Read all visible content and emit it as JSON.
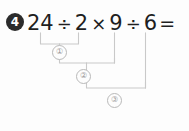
{
  "problem": {
    "number_label": "4",
    "expression_tokens": [
      {
        "kind": "num",
        "text": "24"
      },
      {
        "kind": "op",
        "text": "÷"
      },
      {
        "kind": "num",
        "text": "2"
      },
      {
        "kind": "op",
        "text": "×"
      },
      {
        "kind": "num",
        "text": "9"
      },
      {
        "kind": "op",
        "text": "÷"
      },
      {
        "kind": "num",
        "text": "6"
      },
      {
        "kind": "eq",
        "text": "="
      }
    ],
    "expression_text": "24 ÷ 2 × 9 ÷ 6 =",
    "answer_value": ""
  },
  "steps": [
    {
      "order_label": "①",
      "operation": "÷",
      "operands": [
        "24",
        "2"
      ],
      "covers": "24 ÷ 2"
    },
    {
      "order_label": "②",
      "operation": "×",
      "operands": [
        "step1",
        "9"
      ],
      "covers": "(24 ÷ 2) × 9"
    },
    {
      "order_label": "③",
      "operation": "÷",
      "operands": [
        "step2",
        "6"
      ],
      "covers": "((24 ÷ 2) × 9) ÷ 6"
    }
  ],
  "colors": {
    "background": "#fdfdfd",
    "text": "#1f1f1f",
    "badge_fill": "#2b2b2b",
    "badge_text": "#ffffff",
    "connector_line": "#c9c9c9",
    "marker_text": "#9a9a9a"
  }
}
